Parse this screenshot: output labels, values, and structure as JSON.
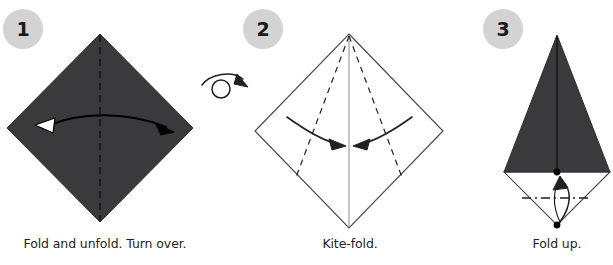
{
  "page": {
    "background_color": "#ffffff",
    "width": 613,
    "height": 265
  },
  "palette": {
    "paper_dark": "#3a3a3c",
    "paper_light": "#ffffff",
    "line": "#231f20",
    "badge_fill": "#d3d3d3",
    "badge_text": "#1a1a1a",
    "caption_text": "#231f20",
    "crease_dash": "#231f20"
  },
  "steps": [
    {
      "number": "1",
      "caption": "Fold and unfold. Turn over.",
      "shape": "square-diamond",
      "paper_side": "colored",
      "creases": [
        {
          "name": "vertical-center-crease",
          "style": "dashed",
          "orientation": "vertical"
        }
      ],
      "arrows": [
        {
          "name": "fold-unfold-arrow",
          "type": "double-headed-curved",
          "direction": "left-right",
          "left_head": "hollow",
          "right_head": "solid"
        }
      ],
      "symbols": []
    },
    {
      "number": "2",
      "caption": "Kite-fold.",
      "shape": "square-diamond",
      "paper_side": "white",
      "creases": [
        {
          "name": "vertical-center-line",
          "style": "solid",
          "orientation": "vertical"
        },
        {
          "name": "left-kite-crease",
          "style": "dashed",
          "orientation": "diagonal-left"
        },
        {
          "name": "right-kite-crease",
          "style": "dashed",
          "orientation": "diagonal-right"
        }
      ],
      "arrows": [
        {
          "name": "left-fold-arrow",
          "type": "curved",
          "direction": "inward-right",
          "head": "solid"
        },
        {
          "name": "right-fold-arrow",
          "type": "curved",
          "direction": "inward-left",
          "head": "solid"
        }
      ],
      "symbols": [
        {
          "name": "turn-over-symbol",
          "type": "loop-arrow-circle"
        }
      ]
    },
    {
      "number": "3",
      "caption": "Fold up.",
      "shape": "kite",
      "paper_side": "colored-top-white-bottom",
      "creases": [
        {
          "name": "vertical-center-line",
          "style": "solid",
          "orientation": "vertical"
        },
        {
          "name": "horizontal-fold-line",
          "style": "dash-dot",
          "orientation": "horizontal"
        }
      ],
      "arrows": [
        {
          "name": "fold-up-arrow",
          "type": "curved",
          "direction": "up",
          "head": "solid"
        }
      ],
      "symbols": [
        {
          "name": "waist-point-dot",
          "type": "dot"
        },
        {
          "name": "bottom-point-dot",
          "type": "dot"
        }
      ]
    }
  ]
}
